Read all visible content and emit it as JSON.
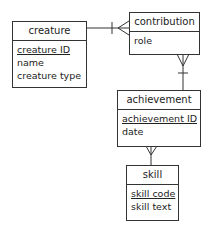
{
  "entities": {
    "creature": {
      "title": "creature",
      "attributes": [
        {
          "name": "creature ID",
          "primary_key": true
        },
        {
          "name": "name",
          "primary_key": false
        },
        {
          "name": "creature type",
          "primary_key": false
        }
      ]
    },
    "contribution": {
      "title": "contribution",
      "attributes": [
        {
          "name": "role",
          "primary_key": false
        }
      ]
    },
    "achievement": {
      "title": "achievement",
      "attributes": [
        {
          "name": "achievement ID",
          "primary_key": true
        },
        {
          "name": "date",
          "primary_key": false
        }
      ]
    },
    "skill": {
      "title": "skill",
      "attributes": [
        {
          "name": "skill code",
          "primary_key": true
        },
        {
          "name": "skill text",
          "primary_key": false
        }
      ]
    }
  },
  "relationships": [
    {
      "from": "creature",
      "to": "contribution",
      "from_cardinality": "one",
      "to_cardinality": "many"
    },
    {
      "from": "achievement",
      "to": "contribution",
      "from_cardinality": "one",
      "to_cardinality": "many"
    },
    {
      "from": "skill",
      "to": "achievement",
      "from_cardinality": "one",
      "to_cardinality": "many"
    }
  ],
  "colors": {
    "line": "#333333",
    "background": "#ffffff"
  }
}
